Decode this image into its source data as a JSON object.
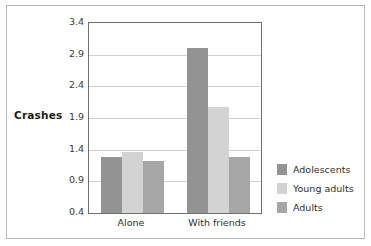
{
  "chart_data": {
    "type": "bar",
    "title": "",
    "xlabel": "",
    "ylabel": "Crashes",
    "categories": [
      "Alone",
      "With friends"
    ],
    "series": [
      {
        "name": "Adolescents",
        "color": "#939393",
        "values": [
          1.28,
          3.0
        ]
      },
      {
        "name": "Young adults",
        "color": "#d3d3d3",
        "values": [
          1.37,
          2.07
        ]
      },
      {
        "name": "Adults",
        "color": "#a6a6a6",
        "values": [
          1.22,
          1.28
        ]
      }
    ],
    "ylim": [
      0.4,
      3.4
    ],
    "yticks": [
      "3.4",
      "2.9",
      "2.4",
      "1.9",
      "1.4",
      "0.9",
      "0.4"
    ],
    "ytick_values": [
      3.4,
      2.9,
      2.4,
      1.9,
      1.4,
      0.9,
      0.4
    ],
    "grid": true,
    "grid_color": "#d0d0d0",
    "legend_position": "right",
    "plot_border_color": "#6f6f6f",
    "frame_color": "#b9b9b9",
    "background": "#ffffff"
  },
  "axis": {
    "y_title": "Crashes"
  },
  "legend": {
    "entries": [
      {
        "label": "Adolescents",
        "color": "#939393"
      },
      {
        "label": "Young adults",
        "color": "#d3d3d3"
      },
      {
        "label": "Adults",
        "color": "#a6a6a6"
      }
    ]
  }
}
